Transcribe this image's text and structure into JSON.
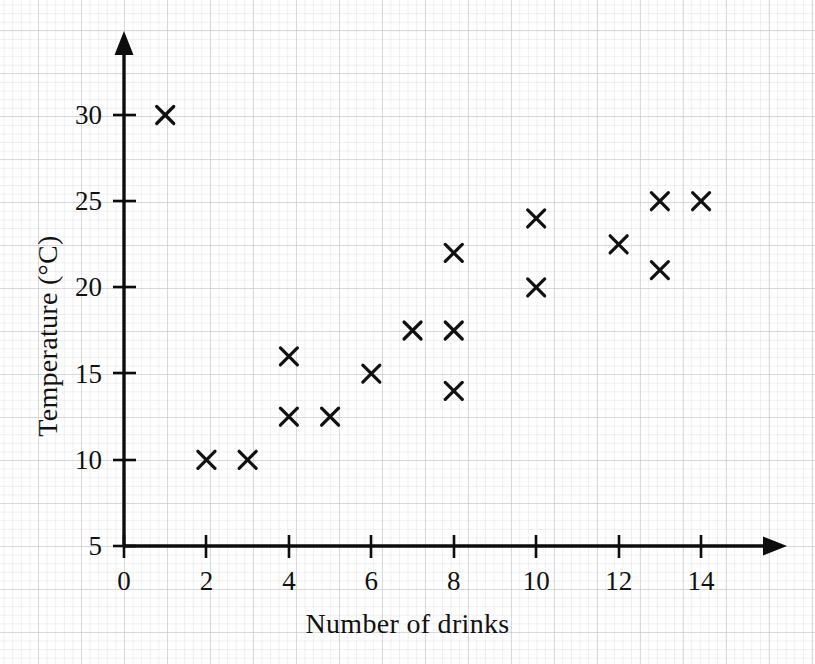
{
  "chart_data": {
    "type": "scatter",
    "title": "",
    "xlabel": "Number of drinks",
    "ylabel": "Temperature (°C)",
    "xlim": [
      0,
      15.5
    ],
    "ylim": [
      5,
      32
    ],
    "xticks": [
      0,
      2,
      4,
      6,
      8,
      10,
      12,
      14
    ],
    "yticks": [
      5,
      10,
      15,
      20,
      25,
      30
    ],
    "xtick_labels": [
      "0",
      "2",
      "4",
      "6",
      "8",
      "10",
      "12",
      "14"
    ],
    "ytick_labels": [
      "5",
      "10",
      "15",
      "20",
      "25",
      "30"
    ],
    "grid": true,
    "grid_style": "graph-paper",
    "legend": false,
    "marker": "x",
    "marker_color": "#111111",
    "axis_color": "#0d0d0d",
    "x": [
      1,
      2,
      3,
      4,
      4,
      5,
      6,
      7,
      8,
      8,
      8,
      10,
      10,
      12,
      13,
      13,
      14
    ],
    "y": [
      30,
      10,
      10,
      16,
      12.5,
      12.5,
      15,
      17.5,
      22,
      17.5,
      14,
      24,
      20,
      22.5,
      25,
      21,
      25
    ],
    "points": [
      {
        "x": 1,
        "y": 30
      },
      {
        "x": 2,
        "y": 10
      },
      {
        "x": 3,
        "y": 10
      },
      {
        "x": 4,
        "y": 16
      },
      {
        "x": 4,
        "y": 12.5
      },
      {
        "x": 5,
        "y": 12.5
      },
      {
        "x": 6,
        "y": 15
      },
      {
        "x": 7,
        "y": 17.5
      },
      {
        "x": 8,
        "y": 22
      },
      {
        "x": 8,
        "y": 17.5
      },
      {
        "x": 8,
        "y": 14
      },
      {
        "x": 10,
        "y": 24
      },
      {
        "x": 10,
        "y": 20
      },
      {
        "x": 12,
        "y": 22.5
      },
      {
        "x": 13,
        "y": 25
      },
      {
        "x": 13,
        "y": 21
      },
      {
        "x": 14,
        "y": 25
      }
    ]
  },
  "axes": {
    "x_title": "Number of drinks",
    "y_title": "Temperature (°C)"
  }
}
